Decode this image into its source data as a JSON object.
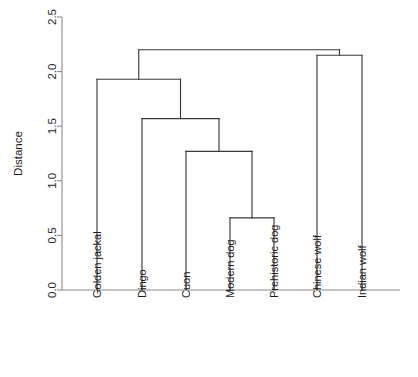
{
  "chart_data": {
    "type": "dendrogram",
    "title": "",
    "xlabel": "",
    "ylabel": "Distance",
    "ylim": [
      0.0,
      2.5
    ],
    "yticks": [
      "0.0",
      "0.5",
      "1.0",
      "1.5",
      "2.0",
      "2.5"
    ],
    "ytick_values": [
      0.0,
      0.5,
      1.0,
      1.5,
      2.0,
      2.5
    ],
    "grid": false,
    "legend": "none",
    "leaf_order": [
      "Golden jackal",
      "Dingo",
      "Cuon",
      "Modern dog",
      "Prehistoric dog",
      "Chinese wolf",
      "Indian wolf"
    ],
    "merges": [
      {
        "id": "m1",
        "height": 0.66,
        "left": "Modern dog",
        "right": "Prehistoric dog",
        "label": "Modern dog + Prehistoric dog"
      },
      {
        "id": "m2",
        "height": 1.27,
        "left": "Cuon",
        "right": "m1",
        "label": "Cuon + (Modern dog, Prehistoric dog)"
      },
      {
        "id": "m3",
        "height": 1.57,
        "left": "Dingo",
        "right": "m2",
        "label": "Dingo + (Cuon, Modern dog, Prehistoric dog)"
      },
      {
        "id": "m4",
        "height": 1.93,
        "left": "Golden jackal",
        "right": "m3",
        "label": "Golden jackal + dog cluster"
      },
      {
        "id": "m5",
        "height": 2.15,
        "left": "Chinese wolf",
        "right": "Indian wolf",
        "label": "Chinese wolf + Indian wolf"
      },
      {
        "id": "m6",
        "height": 2.2,
        "left": "m4",
        "right": "m5",
        "label": "root"
      }
    ],
    "colors": {
      "tree": "#3a3a3a",
      "axis": "#8a8a8a",
      "text": "#1c1c1c",
      "background": "#ffffff"
    }
  }
}
